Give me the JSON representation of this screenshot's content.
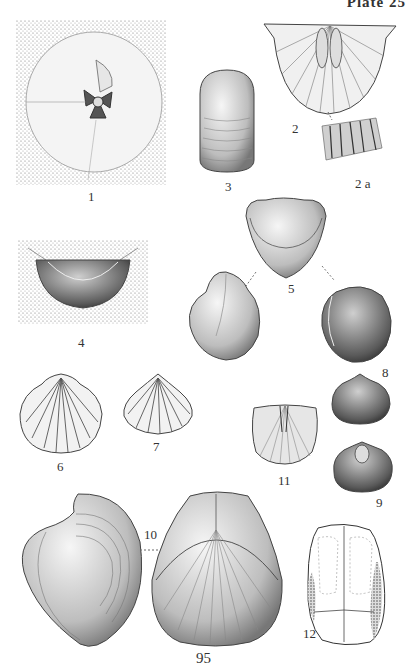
{
  "plate": {
    "title": "Plate 25",
    "page_number": "95"
  },
  "figures": [
    {
      "id": "fig-1",
      "label": "1",
      "description": "stippled rectangular matrix with circular shell, central hinge structure"
    },
    {
      "id": "fig-2",
      "label": "2",
      "description": "wide hinged valve with radial ribs and central plates"
    },
    {
      "id": "fig-2a",
      "label": "2 a",
      "description": "detail of ribbing"
    },
    {
      "id": "fig-3",
      "label": "3",
      "description": "elongated oval shell with concentric growth lines"
    },
    {
      "id": "fig-4",
      "label": "4",
      "description": "half-oval shell impression in stippled matrix"
    },
    {
      "id": "fig-5",
      "label": "5",
      "description": "three views of smooth rounded shell joined by dashed lines"
    },
    {
      "id": "fig-6",
      "label": "6",
      "description": "ribbed fan-shaped shell"
    },
    {
      "id": "fig-7",
      "label": "7",
      "description": "smaller ribbed triangular shell"
    },
    {
      "id": "fig-8",
      "label": "8",
      "description": "rounded stippled shell with beak"
    },
    {
      "id": "fig-9",
      "label": "9",
      "description": "finely ribbed shell with central boss"
    },
    {
      "id": "fig-10",
      "label": "10",
      "description": "squarish finely ribbed valve"
    },
    {
      "id": "fig-11",
      "label": "11",
      "description": "large coiled shell side view and ribbed front view joined by dashed line"
    },
    {
      "id": "fig-12",
      "label": "12",
      "description": "outline drawing of internal mould"
    }
  ],
  "colors": {
    "ink": "#333333",
    "stipple": "#8a8a8a",
    "paper": "#ffffff"
  }
}
